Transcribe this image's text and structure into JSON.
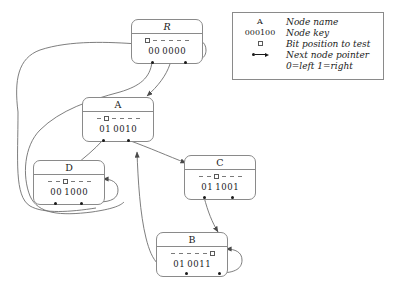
{
  "figure": {
    "title": "",
    "background": "#ffffff",
    "line_color": "#8a8a8a",
    "text_color": "#1a1a1a"
  },
  "legend": {
    "rows": [
      {
        "symbol": "A",
        "symbol_kind": "text",
        "description": "Node name"
      },
      {
        "symbol": "000100",
        "symbol_kind": "text",
        "description": "Node key"
      },
      {
        "symbol": "",
        "symbol_kind": "box",
        "description": "Bit position to test"
      },
      {
        "symbol": "",
        "symbol_kind": "pointer",
        "description": "Next node pointer"
      },
      {
        "symbol": "",
        "symbol_kind": "none",
        "description": "0=left 1=right"
      }
    ]
  },
  "nodes": [
    {
      "id": "R",
      "name": "R",
      "name_style": "script",
      "test_bit_index": 0,
      "bit_marks": [
        "box",
        "dash",
        "dash",
        "dash",
        "dash",
        "dash"
      ],
      "key_digits": [
        "0",
        "0",
        "0",
        "0",
        "0",
        "0"
      ],
      "key_text": "0 0 0000"
    },
    {
      "id": "A",
      "name": "A",
      "name_style": "roman",
      "test_bit_index": 1,
      "bit_marks": [
        "dash",
        "box",
        "dash",
        "dash",
        "dash",
        "dash"
      ],
      "key_digits": [
        "0",
        "1",
        "0",
        "0",
        "1",
        "0"
      ],
      "key_text": "0 1 0010"
    },
    {
      "id": "D",
      "name": "D",
      "name_style": "roman",
      "test_bit_index": 2,
      "bit_marks": [
        "dash",
        "dash",
        "box",
        "dash",
        "dash",
        "dash"
      ],
      "key_digits": [
        "0",
        "0",
        "1",
        "0",
        "0",
        "0"
      ],
      "key_text": "0 0 1000"
    },
    {
      "id": "C",
      "name": "C",
      "name_style": "roman",
      "test_bit_index": 2,
      "bit_marks": [
        "dash",
        "dash",
        "box",
        "dash",
        "dash",
        "dash"
      ],
      "key_digits": [
        "0",
        "1",
        "1",
        "0",
        "0",
        "1"
      ],
      "key_text": "0 1 1001"
    },
    {
      "id": "B",
      "name": "B",
      "name_style": "roman",
      "test_bit_index": 5,
      "bit_marks": [
        "dash",
        "dash",
        "dash",
        "dash",
        "dash",
        "box"
      ],
      "key_digits": [
        "0",
        "1",
        "0",
        "0",
        "1",
        "1"
      ],
      "key_text": "0 1 0011"
    }
  ],
  "edges": [
    {
      "from": "R",
      "branch": "0",
      "to": "R",
      "kind": "back-edge-left"
    },
    {
      "from": "R",
      "branch": "1",
      "to": "R",
      "kind": "self-loop-right"
    },
    {
      "from": "R",
      "branch": "down",
      "to": "A",
      "kind": "forward"
    },
    {
      "from": "A",
      "branch": "0",
      "to": "D",
      "kind": "forward"
    },
    {
      "from": "A",
      "branch": "1",
      "to": "C",
      "kind": "forward"
    },
    {
      "from": "D",
      "branch": "1",
      "to": "D",
      "kind": "self-loop-right"
    },
    {
      "from": "D",
      "branch": "0",
      "to": "R",
      "kind": "back-edge-left"
    },
    {
      "from": "C",
      "branch": "0",
      "to": "B",
      "kind": "forward"
    },
    {
      "from": "C",
      "branch": "1",
      "to": "C",
      "kind": "self-loop-right"
    },
    {
      "from": "B",
      "branch": "0",
      "to": "A",
      "kind": "back-edge-up"
    },
    {
      "from": "B",
      "branch": "1",
      "to": "B",
      "kind": "self-loop-right"
    }
  ]
}
